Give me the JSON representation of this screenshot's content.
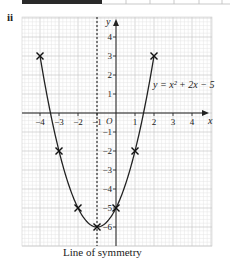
{
  "part_label": "ii",
  "caption": "Line of symmetry",
  "chart_data": {
    "type": "line",
    "title": "",
    "equation": "y = x² + 2x − 5",
    "xlabel": "x",
    "ylabel": "y",
    "xlim": [
      -4.5,
      4.6
    ],
    "ylim": [
      -7,
      4.9
    ],
    "x_ticks": [
      -4,
      -3,
      -2,
      -1,
      1,
      2,
      3,
      4
    ],
    "y_ticks": [
      4,
      3,
      2,
      1,
      -1,
      -2,
      -3,
      -4,
      -5,
      -6
    ],
    "origin_label": "O",
    "grid": true,
    "points": [
      {
        "x": -4,
        "y": 3
      },
      {
        "x": -3,
        "y": -2
      },
      {
        "x": -2,
        "y": -5
      },
      {
        "x": -1,
        "y": -6
      },
      {
        "x": 0,
        "y": -5
      },
      {
        "x": 1,
        "y": -2
      },
      {
        "x": 2,
        "y": 3
      }
    ],
    "line_of_symmetry": {
      "x": -1,
      "label": "Line of symmetry"
    },
    "vertex": {
      "x": -1,
      "y": -6
    }
  },
  "colors": {
    "grid_minor": "#e4e4e4",
    "grid_major": "#c8c8c8",
    "axis": "#222222",
    "curve": "#222222",
    "top_bar": "#2a2a2a"
  }
}
